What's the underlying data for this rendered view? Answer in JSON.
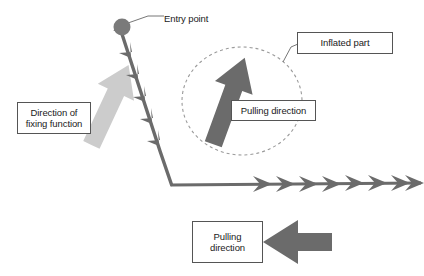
{
  "diagram": {
    "background_color": "#ffffff",
    "colors": {
      "dark_gray": "#6b6b6b",
      "mid_gray": "#7a7a7a",
      "light_gray": "#cccccc",
      "outline_gray": "#555555",
      "text": "#1a1a1a",
      "dashed_ellipse": "#9a9a9a"
    }
  },
  "labels": {
    "entry_point": {
      "text": "Entry point",
      "boxed": false,
      "leader_line": true
    },
    "fixing_direction": {
      "text": "Direction of\nfixing function",
      "boxed": true,
      "leader_line": false
    },
    "inflated_part": {
      "text": "Inflated part",
      "boxed": true,
      "leader_line": true
    },
    "pulling_direction_ellipse": {
      "text": "Pulling direction",
      "boxed": true,
      "leader_line": false
    },
    "pulling_direction_bottom": {
      "text": "Pulling\ndirection",
      "boxed": true,
      "leader_line": false
    }
  },
  "shapes": {
    "entry_dot": {
      "name": "entry-point-dot",
      "cx": 122,
      "cy": 27,
      "r": 8,
      "fill": "#7a7a7a"
    },
    "barbed_suture": {
      "name": "barbed-suture-line",
      "description": "Barbed line from entry dot down to corner, barbs point up toward entry point",
      "barb_count": 6,
      "color": "#6b6b6b"
    },
    "horizontal_chevron_line": {
      "name": "horizontal-chevron-line",
      "description": "Horizontal line with chevrons pointing right",
      "chevron_count": 8,
      "color": "#6b6b6b"
    },
    "dashed_ellipse": {
      "name": "inflated-part-ellipse",
      "cx": 242,
      "cy": 101,
      "rx": 60,
      "ry": 54,
      "stroke": "#9a9a9a",
      "dash": "3 3"
    },
    "pulling_arrow_up": {
      "name": "pulling-direction-arrow-up",
      "fill": "#6b6b6b",
      "rotation_deg": 20
    },
    "fixing_arrow_down": {
      "name": "fixing-direction-arrow-down",
      "fill": "#cccccc",
      "rotation_deg": 205
    },
    "pulling_arrow_left": {
      "name": "pulling-direction-arrow-left",
      "fill": "#6b6b6b",
      "rotation_deg": 270
    }
  }
}
